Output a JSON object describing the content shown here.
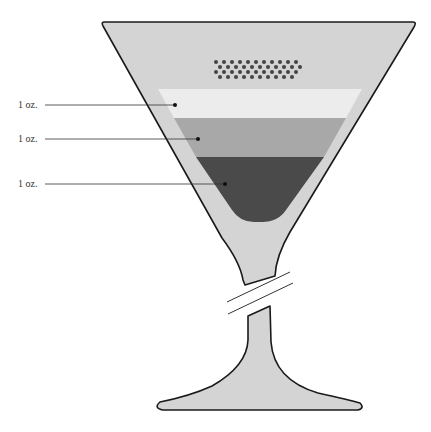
{
  "diagram": {
    "colors": {
      "glass": "#d4d4d4",
      "outline": "#1a1a1a",
      "layer_top": "#ececec",
      "layer_middle": "#a8a8a8",
      "layer_bottom": "#4a4a4a",
      "garnish": "#444444"
    },
    "layers": [
      {
        "label": "1 oz.",
        "label_y": 105,
        "dot_x": 175,
        "shade": "light"
      },
      {
        "label": "1 oz.",
        "label_y": 139,
        "dot_x": 198,
        "shade": "medium"
      },
      {
        "label": "1 oz.",
        "label_y": 184,
        "dot_x": 225,
        "shade": "dark"
      }
    ],
    "garnish": "dotted-float"
  }
}
